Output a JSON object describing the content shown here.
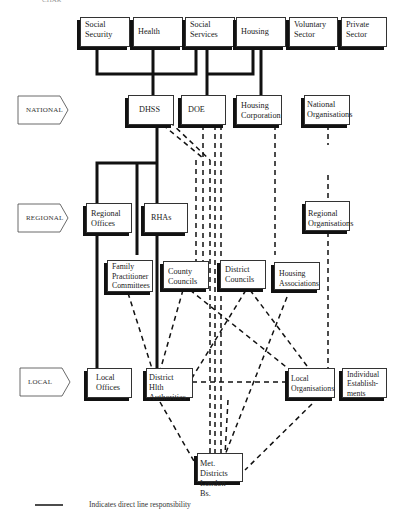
{
  "header": {
    "fragment": "CHAR"
  },
  "levels": [
    {
      "id": "national",
      "label": "NATIONAL"
    },
    {
      "id": "regional",
      "label": "REGIONAL"
    },
    {
      "id": "local",
      "label": "LOCAL"
    }
  ],
  "top_sectors": {
    "social_security": "Social\nSecurity",
    "health": "Health",
    "social_services": "Social\nServices",
    "housing": "Housing",
    "voluntary_sector": "Voluntary\nSector",
    "private_sector": "Private\nSector"
  },
  "national": {
    "dhss": "DHSS",
    "doe": "DOE",
    "housing_corporation": "Housing\nCorporation",
    "national_organisations": "National\nOrganisations"
  },
  "regional": {
    "regional_offices": "Regional\nOffices",
    "rhas": "RHAs",
    "regional_organisations": "Regional\nOrganisations"
  },
  "intermediate": {
    "family_practitioner_committees": "Family\nPractitioner\nCommittees",
    "county_councils": "County\nCouncils",
    "district_councils": "District\nCouncils",
    "housing_associations": "Housing\nAssociations"
  },
  "local": {
    "local_offices": "Local\nOffices",
    "district_hlth_authorities": "District Hlth\nAuthorities",
    "local_organisations": "Local\nOrganisations",
    "individual_establishments": "Individual\nEstablish-\nments",
    "met_districts": "Met. Districts\nLondon Bs."
  },
  "legend": {
    "solid_line_text": "Indicates direct line responsibility"
  },
  "colors": {
    "line": "#111111",
    "box_border": "#333333",
    "background": "#ffffff"
  }
}
